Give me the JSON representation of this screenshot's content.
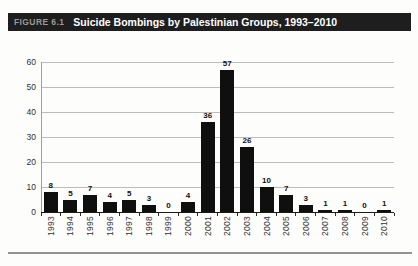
{
  "figure": {
    "label": "FIGURE 6.1",
    "title": "Suicide Bombings by Palestinian Groups, 1993–2010"
  },
  "chart_data": {
    "type": "bar",
    "title": "Suicide Bombings by Palestinian Groups, 1993–2010",
    "categories": [
      "1993",
      "1994",
      "1995",
      "1996",
      "1997",
      "1998",
      "1999",
      "2000",
      "2001",
      "2002",
      "2003",
      "2004",
      "2005",
      "2006",
      "2007",
      "2008",
      "2009",
      "2010"
    ],
    "values": [
      8,
      5,
      7,
      4,
      5,
      3,
      0,
      4,
      36,
      57,
      26,
      10,
      7,
      3,
      1,
      1,
      0,
      1
    ],
    "xlabel": "",
    "ylabel": "",
    "ylim": [
      0,
      60
    ],
    "y_ticks": [
      0,
      10,
      20,
      30,
      40,
      50,
      60
    ],
    "grid": true,
    "legend": "none",
    "value_labels": true,
    "bar_color": "#0f0f0f",
    "gridline_color": "#bcbcbc"
  }
}
